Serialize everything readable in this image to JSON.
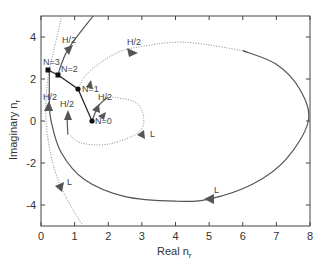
{
  "chart_data": {
    "type": "line",
    "title": "",
    "xlabel": "Real n",
    "xlabel_sub": "r",
    "ylabel": "Imaginary n",
    "ylabel_sub": "r",
    "xlim": [
      0,
      8
    ],
    "ylim": [
      -5,
      5
    ],
    "xticks": [
      0,
      1,
      2,
      3,
      4,
      5,
      6,
      7,
      8
    ],
    "yticks": [
      -4,
      -2,
      0,
      2,
      4
    ],
    "grid": false,
    "legend": null,
    "layer_points": [
      {
        "label": "N=0",
        "x": 1.52,
        "y": 0.0
      },
      {
        "label": "N=1",
        "x": 1.1,
        "y": 1.52
      },
      {
        "label": "N=2",
        "x": 0.5,
        "y": 2.2
      },
      {
        "label": "N=3",
        "x": 0.2,
        "y": 2.43
      }
    ],
    "series": [
      {
        "name": "large loop (solid, L)",
        "style": "solid",
        "points": [
          [
            0.25,
            2.43
          ],
          [
            0.25,
            1.0
          ],
          [
            0.3,
            0.0
          ],
          [
            0.6,
            -1.5
          ],
          [
            1.3,
            -2.8
          ],
          [
            2.5,
            -3.6
          ],
          [
            4.0,
            -3.82
          ],
          [
            5.0,
            -3.72
          ],
          [
            6.3,
            -3.0
          ],
          [
            7.3,
            -1.8
          ],
          [
            7.95,
            0.0
          ],
          [
            7.7,
            1.5
          ],
          [
            7.0,
            2.7
          ],
          [
            6.0,
            3.35
          ]
        ]
      },
      {
        "name": "large loop (dotted, H/2)",
        "style": "dotted",
        "points": [
          [
            6.0,
            3.35
          ],
          [
            4.3,
            3.75
          ],
          [
            3.0,
            3.55
          ],
          [
            2.2,
            3.2
          ],
          [
            1.4,
            2.3
          ],
          [
            1.1,
            1.52
          ]
        ]
      },
      {
        "name": "small loop (solid, H/2)",
        "style": "solid",
        "points": [
          [
            1.52,
            0.0
          ],
          [
            1.7,
            0.7
          ],
          [
            2.0,
            1.15
          ]
        ]
      },
      {
        "name": "small loop (dotted, L)",
        "style": "dotted",
        "points": [
          [
            2.05,
            1.15
          ],
          [
            2.8,
            0.9
          ],
          [
            3.05,
            0.2
          ],
          [
            2.9,
            -0.55
          ],
          [
            2.0,
            -1.1
          ],
          [
            1.2,
            -1.05
          ],
          [
            0.85,
            -0.65
          ]
        ]
      },
      {
        "name": "small loop return (solid, H/2)",
        "style": "solid",
        "points": [
          [
            0.8,
            -0.65
          ],
          [
            0.78,
            0.0
          ],
          [
            0.8,
            0.35
          ]
        ]
      },
      {
        "name": "outer curve (solid, H/2)",
        "style": "solid",
        "points": [
          [
            0.5,
            2.2
          ],
          [
            0.8,
            3.4
          ],
          [
            1.55,
            5.0
          ]
        ]
      },
      {
        "name": "outer curve (dotted, L)",
        "style": "dotted",
        "points": [
          [
            0.62,
            5.0
          ],
          [
            0.4,
            3.5
          ],
          [
            0.2,
            2.0
          ],
          [
            0.15,
            0.0
          ],
          [
            0.35,
            -2.0
          ],
          [
            0.7,
            -3.5
          ],
          [
            1.25,
            -5.0
          ]
        ]
      }
    ],
    "annotations": [
      {
        "text": "H/2",
        "x": 0.7,
        "y": 3.8
      },
      {
        "text": "H/2",
        "x": 2.65,
        "y": 3.85
      },
      {
        "text": "H/2",
        "x": 0.15,
        "y": 0.85
      },
      {
        "text": "H/2",
        "x": 0.65,
        "y": 0.55
      },
      {
        "text": "H/2",
        "x": 1.85,
        "y": 0.75
      },
      {
        "text": "L",
        "x": 3.2,
        "y": -0.75
      },
      {
        "text": "L",
        "x": 0.75,
        "y": -2.9
      },
      {
        "text": "L",
        "x": 5.15,
        "y": -3.35
      }
    ]
  },
  "axes": {
    "xlabel": "Real n",
    "xlabel_sub": "r",
    "ylabel": "Imaginary n",
    "ylabel_sub": "r",
    "xtick_labels": [
      "0",
      "1",
      "2",
      "3",
      "4",
      "5",
      "6",
      "7",
      "8"
    ],
    "ytick_labels": [
      "4",
      "2",
      "0",
      "-2",
      "-4"
    ]
  },
  "labels": {
    "n0": "N=0",
    "n1": "N=1",
    "n2": "N=2",
    "n3": "N=3",
    "h2": "H/2",
    "l": "L"
  },
  "colors": {
    "solid": "#555555",
    "dotted": "#888888",
    "points": "#111111"
  }
}
